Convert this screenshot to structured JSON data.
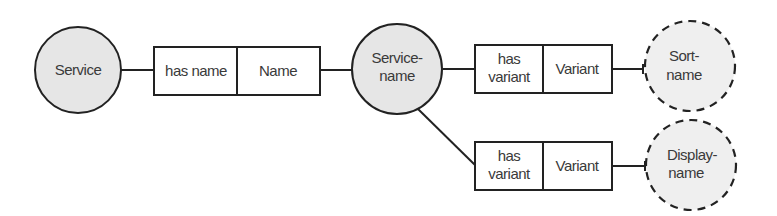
{
  "diagram": {
    "nodes": {
      "service": {
        "label": "Service",
        "style": "solid-circle",
        "fill": "#e6e6e6"
      },
      "service_name": {
        "line1": "Service-",
        "line2": "name",
        "style": "solid-circle",
        "fill": "#e6e6e6"
      },
      "sort_name": {
        "line1": "Sort-",
        "line2": "name",
        "style": "dashed-circle",
        "fill": "#efefef"
      },
      "display_name": {
        "line1": "Display-",
        "line2": "name",
        "style": "dashed-circle",
        "fill": "#efefef"
      }
    },
    "relations": [
      {
        "role": "has name",
        "target": "Name"
      },
      {
        "role_line1": "has",
        "role_line2": "variant",
        "target": "Variant"
      },
      {
        "role_line1": "has",
        "role_line2": "variant",
        "target": "Variant"
      }
    ],
    "edges": [
      {
        "from": "Service",
        "to": "has name / Name"
      },
      {
        "from": "has name / Name",
        "to": "Service-name"
      },
      {
        "from": "Service-name",
        "to": "has variant / Variant (1)"
      },
      {
        "from": "has variant / Variant (1)",
        "to": "Sort-name"
      },
      {
        "from": "Service-name",
        "to": "has variant / Variant (2)"
      },
      {
        "from": "has variant / Variant (2)",
        "to": "Display-name"
      }
    ],
    "colors": {
      "stroke": "#222222",
      "text": "#3a3a3a"
    }
  }
}
